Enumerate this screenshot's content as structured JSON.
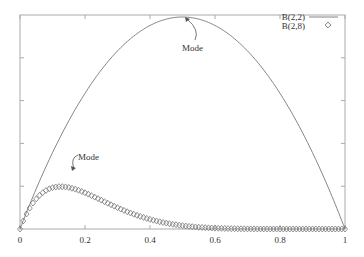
{
  "chart_data": {
    "type": "line",
    "title": "",
    "xlabel": "",
    "ylabel": "",
    "xlim": [
      0,
      1
    ],
    "ylim": [
      0,
      1
    ],
    "x_ticks": [
      "0",
      "0.2",
      "0.4",
      "0.6",
      "0.8",
      "1"
    ],
    "y_ticks_count": 5,
    "grid": false,
    "legend_position": "top-right",
    "series": [
      {
        "name": "B(2,2)",
        "style": "line",
        "alpha": 2,
        "beta": 2,
        "peak_x": 0.5,
        "relative_peak": 1.0
      },
      {
        "name": "B(2,8)",
        "style": "diamond-markers",
        "alpha": 2,
        "beta": 8,
        "peak_x": 0.125,
        "relative_peak": 0.2
      }
    ],
    "annotations": [
      {
        "text": "Mode",
        "x": 0.5,
        "target": "B(2,2)"
      },
      {
        "text": "Mode",
        "x": 0.125,
        "target": "B(2,8)"
      }
    ]
  },
  "colors": {
    "line": "#666666",
    "axis": "#999999",
    "text": "#333333"
  }
}
